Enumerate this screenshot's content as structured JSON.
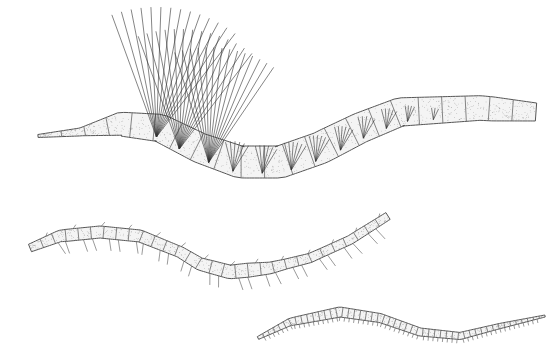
{
  "figure": {
    "type": "scientific-illustration",
    "background": "#ffffff",
    "ink_color": "#333333",
    "fill_color": "#f4f4f4",
    "specimens": [
      {
        "name": "upper-worm",
        "description": "stout segmented worm with tall bristle tufts (chaetae) on dorsal segments",
        "segment_count": 22
      },
      {
        "name": "middle-worm",
        "description": "slender worm with sparse hairs and a darker clitellum-like band",
        "segment_count": 30
      },
      {
        "name": "lower-worm",
        "description": "long thin worm with many fine segments and short setae",
        "segment_count": 50
      }
    ]
  }
}
